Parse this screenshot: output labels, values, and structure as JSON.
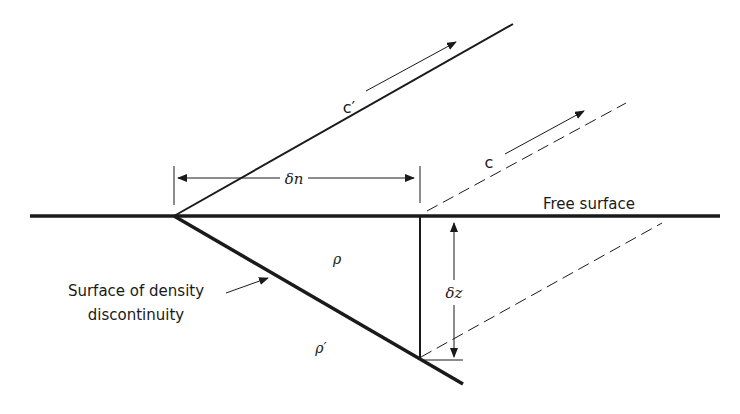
{
  "diagram": {
    "type": "physics-schematic",
    "labels": {
      "c_prime": "c′",
      "c": "c",
      "delta_n": "δn",
      "free_surface": "Free surface",
      "rho": "ρ",
      "rho_prime": "ρ′",
      "delta_z": "δz",
      "density_surface_line1": "Surface of density",
      "density_surface_line2": "discontinuity"
    },
    "colors": {
      "ink": "#1a1a1a",
      "background": "#ffffff"
    },
    "elements": [
      {
        "name": "free-surface-line",
        "style": "thick solid",
        "from": [
          30,
          216
        ],
        "to": [
          720,
          216
        ]
      },
      {
        "name": "c-prime-ray",
        "style": "solid",
        "from": [
          174,
          216
        ],
        "to": [
          513,
          24
        ]
      },
      {
        "name": "c-prime-direction-arrow",
        "style": "thin arrow",
        "from": [
          366,
          91
        ],
        "to": [
          456,
          42
        ]
      },
      {
        "name": "density-discontinuity-line",
        "style": "thick solid",
        "from": [
          174,
          216
        ],
        "to": [
          463,
          384
        ]
      },
      {
        "name": "vertical-drop-line",
        "style": "solid",
        "from": [
          417,
          216
        ],
        "to": [
          417,
          357
        ]
      },
      {
        "name": "c-dashed-ray-upper",
        "style": "dashed",
        "from": [
          427,
          212
        ],
        "to": [
          626,
          102
        ]
      },
      {
        "name": "c-direction-arrow",
        "style": "thin arrow",
        "from": [
          505,
          154
        ],
        "to": [
          584,
          112
        ]
      },
      {
        "name": "c-dashed-ray-lower",
        "style": "dashed",
        "from": [
          420,
          357
        ],
        "to": [
          662,
          222
        ]
      },
      {
        "name": "delta-n-dimension",
        "style": "double arrow",
        "from": [
          176,
          178
        ],
        "to": [
          416,
          178
        ]
      },
      {
        "name": "delta-z-dimension",
        "style": "double arrow",
        "from": [
          454,
          226
        ],
        "to": [
          454,
          356
        ]
      },
      {
        "name": "density-label-leader",
        "style": "thin arrow",
        "from": [
          226,
          294
        ],
        "to": [
          269,
          278
        ]
      }
    ]
  }
}
